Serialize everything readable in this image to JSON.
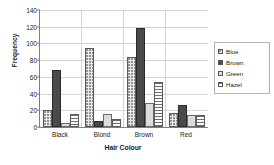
{
  "chart_data": {
    "type": "bar",
    "title": "",
    "xlabel": "Hair Colour",
    "ylabel": "Frequency",
    "categories": [
      "Black",
      "Blond",
      "Brown",
      "Red"
    ],
    "series": [
      {
        "name": "Blue",
        "values": [
          20,
          94,
          84,
          17
        ],
        "swatch": "dotted-light"
      },
      {
        "name": "Brown",
        "values": [
          68,
          7,
          119,
          26
        ],
        "swatch": "solid-dark"
      },
      {
        "name": "Green",
        "values": [
          5,
          16,
          29,
          14
        ],
        "swatch": "solid-light"
      },
      {
        "name": "Hazel",
        "values": [
          15,
          10,
          54,
          14
        ],
        "swatch": "horizontal-stripes"
      }
    ],
    "ylim": [
      0,
      140
    ],
    "yticks": [
      0,
      20,
      40,
      60,
      80,
      100,
      120,
      140
    ],
    "ytick_labels": [
      "0",
      "20",
      "40",
      "60",
      "80",
      "100",
      "120",
      "140"
    ],
    "grid": true,
    "legend_position": "right",
    "legend_entries": [
      "Blue",
      "Brown",
      "Green",
      "Hazel"
    ],
    "colors": {
      "blue_series": "#e9e9e9",
      "brown_series": "#4a4a4a",
      "green_series": "#dcdcdc",
      "hazel_series": "#fbfbfb",
      "gridline": "#d4d4d4",
      "axis": "#7f7f7f",
      "text": "#1a1a1a"
    }
  }
}
